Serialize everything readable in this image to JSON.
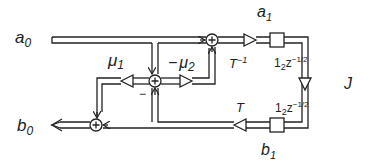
{
  "diagram": {
    "type": "signal-flow / lattice wave-digital adaptor",
    "labels": {
      "a0": {
        "base": "a",
        "sub": "0"
      },
      "b0": {
        "base": "b",
        "sub": "0"
      },
      "a1": {
        "base": "a",
        "sub": "1"
      },
      "b1": {
        "base": "b",
        "sub": "1"
      },
      "mu1": {
        "base": "μ",
        "sub": "1"
      },
      "mu2": {
        "prefix": "−",
        "base": "μ",
        "sub": "2"
      },
      "minus_sign": "−",
      "T_inv": {
        "base": "T",
        "sup": "−1"
      },
      "T": {
        "base": "T"
      },
      "delay_top": {
        "pre": "1",
        "sub": "2",
        "base": "z",
        "sup": "−1/2"
      },
      "delay_bottom": {
        "pre": "1",
        "sub": "2",
        "base": "z",
        "sup": "−1/2"
      },
      "J": "J"
    },
    "nodes": [
      {
        "id": "sum-center",
        "symbol": "+"
      },
      {
        "id": "sum-top",
        "symbol": "+"
      },
      {
        "id": "sum-bottom",
        "symbol": "+"
      }
    ],
    "colors": {
      "stroke": "#222222",
      "background": "#ffffff"
    }
  }
}
